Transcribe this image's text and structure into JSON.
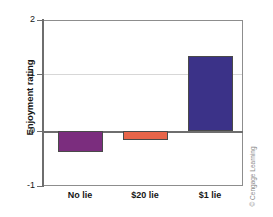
{
  "chart_data": {
    "type": "bar",
    "title": "",
    "xlabel": "",
    "ylabel": "Enjoyment rating",
    "categories": [
      "No lie",
      "$20 lie",
      "$1 lie"
    ],
    "values": [
      -0.38,
      -0.17,
      1.35
    ],
    "bar_colors": [
      "#7B2D7E",
      "#E8654A",
      "#3B3288"
    ],
    "ylim": [
      -1,
      2
    ],
    "yticks": [
      2,
      1,
      0,
      -1
    ],
    "ytick_labels": [
      "2",
      "1",
      "0",
      "-1"
    ],
    "gridlines": [
      1
    ],
    "zero_line": 0,
    "grid": true,
    "legend": "none",
    "series": [
      {
        "name": "Enjoyment rating",
        "values": [
          -0.38,
          -0.17,
          1.35
        ]
      }
    ]
  },
  "axis": {
    "y_title": "Enjoyment rating",
    "y_labels": {
      "t0": "2",
      "t1": "1",
      "t2": "0",
      "t3": "-1"
    },
    "x_labels": {
      "c0": "No lie",
      "c1": "$20 lie",
      "c2": "$1 lie"
    }
  },
  "credit": {
    "text": "© Cengage Learning"
  }
}
